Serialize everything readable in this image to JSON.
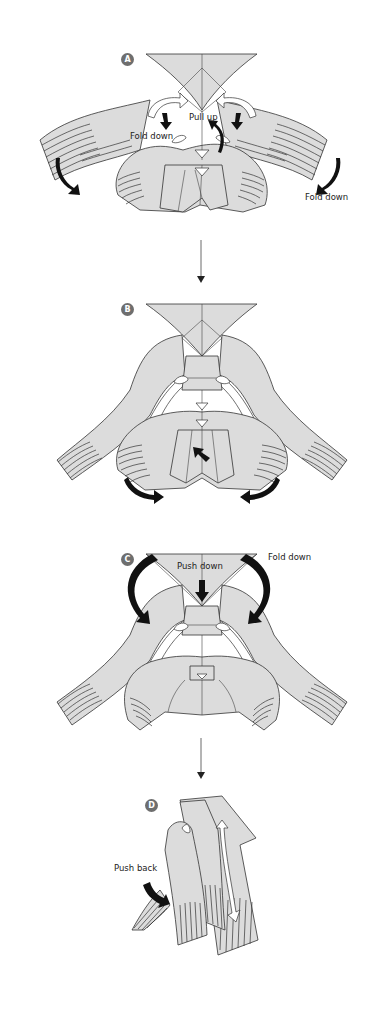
{
  "diagram": {
    "type": "origami-instructions",
    "colors": {
      "paper": "#dcdcdc",
      "outline": "#333333",
      "badge": "#6e6e6e",
      "arrow_black": "#111111",
      "arrow_white": "#ffffff",
      "background": "#ffffff"
    },
    "steps": [
      {
        "id": "A",
        "badge": "A",
        "labels": {
          "pull_up": "Pull up",
          "fold_down_left": "Fold down",
          "fold_down_right": "Fold down"
        },
        "arrows": [
          "white-arrow-left",
          "white-arrow-right",
          "black-arrow-left-inner",
          "black-arrow-right-inner",
          "black-arrow-center",
          "black-arrow-left-outer",
          "black-arrow-right-outer"
        ]
      },
      {
        "id": "B",
        "badge": "B",
        "labels": {},
        "arrows": [
          "black-arrow-center-push",
          "black-arrow-left-bottom",
          "black-arrow-right-bottom"
        ]
      },
      {
        "id": "C",
        "badge": "C",
        "labels": {
          "push_down": "Push down",
          "fold_down": "Fold down"
        },
        "arrows": [
          "black-arrow-left-big",
          "black-arrow-right-big",
          "black-arrow-center-down"
        ]
      },
      {
        "id": "D",
        "badge": "D",
        "labels": {
          "push_back": "Push back"
        },
        "arrows": [
          "black-arrow-push-back",
          "white-arrow-long"
        ]
      }
    ],
    "connectors": [
      {
        "from": "A",
        "to": "B"
      },
      {
        "from": "C",
        "to": "D"
      }
    ]
  }
}
